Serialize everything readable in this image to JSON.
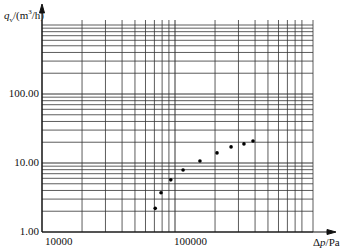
{
  "chart_data": {
    "type": "scatter",
    "title": "",
    "xlabel": "Δp/Pa",
    "ylabel": "q_v/(m³/h)",
    "xscale": "log",
    "yscale": "log",
    "xlim": [
      10000,
      1000000
    ],
    "ylim": [
      1,
      1000
    ],
    "grid": true,
    "x_tick_labels": [
      "10000",
      "100000"
    ],
    "y_tick_labels": [
      "1.00",
      "10.00",
      "100.00"
    ],
    "series": [
      {
        "name": "measured",
        "x": [
          71000,
          78500,
          93000,
          115000,
          154000,
          207000,
          264000,
          330000,
          386000
        ],
        "y": [
          2.2,
          3.7,
          5.7,
          7.9,
          10.7,
          14.0,
          17.1,
          18.9,
          20.8
        ]
      }
    ]
  },
  "axes": {
    "y_title_q": "q",
    "y_title_sub": "v",
    "y_title_rest": "/(m",
    "y_title_sup": "3",
    "y_title_end": "/h)",
    "x_title_delta": "Δ",
    "x_title_p": "p",
    "x_title_rest": "/Pa",
    "y_ticks": [
      "1.00",
      "10.00",
      "100.00"
    ],
    "x_ticks": [
      "10000",
      "100000"
    ]
  }
}
